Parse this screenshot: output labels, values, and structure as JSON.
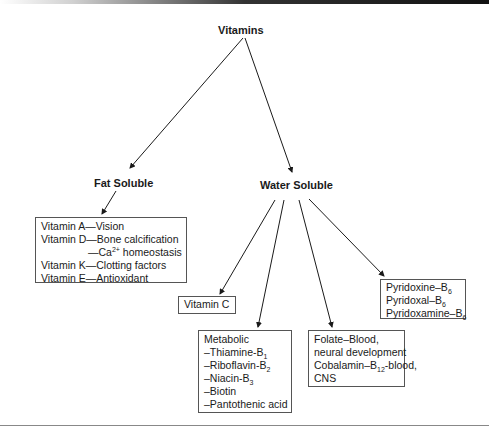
{
  "diagram": {
    "root": {
      "label": "Vitamins"
    },
    "categories": [
      {
        "id": "fat",
        "label": "Fat Soluble",
        "boxes": [
          {
            "id": "fat-box",
            "lines": [
              {
                "text": "Vitamin A—Vision"
              },
              {
                "text": "Vitamin D—Bone calcification"
              },
              {
                "pre": "—Ca",
                "sup": "2+",
                "post": " homeostasis",
                "indent": true
              },
              {
                "text": "Vitamin K—Clotting factors"
              },
              {
                "text": "Vitamin E—Antioxidant"
              }
            ]
          }
        ]
      },
      {
        "id": "water",
        "label": "Water Soluble",
        "boxes": [
          {
            "id": "vitamin-c",
            "lines": [
              {
                "text": "Vitamin C"
              }
            ]
          },
          {
            "id": "metabolic",
            "lines": [
              {
                "text": "Metabolic"
              },
              {
                "pre": "–Thiamine-B",
                "sub": "1"
              },
              {
                "pre": "–Riboflavin-B",
                "sub": "2"
              },
              {
                "pre": "–Niacin-B",
                "sub": "3"
              },
              {
                "text": "–Biotin"
              },
              {
                "text": "–Pantothenic acid"
              }
            ]
          },
          {
            "id": "folate-cobalamin",
            "lines": [
              {
                "text": "Folate–Blood,"
              },
              {
                "text": "neural development"
              },
              {
                "pre": "Cobalamin–B",
                "sub": "12",
                "post": "-blood,"
              },
              {
                "text": "CNS"
              }
            ]
          },
          {
            "id": "b6",
            "lines": [
              {
                "pre": "Pyridoxine–B",
                "sub": "6"
              },
              {
                "pre": "Pyridoxal–B",
                "sub": "6"
              },
              {
                "pre": "Pyridoxamine–B",
                "sub": "6"
              }
            ]
          }
        ]
      }
    ]
  },
  "colors": {
    "line": "#1a1a1a",
    "box_border": "#555555",
    "text": "#1a1a1a"
  }
}
